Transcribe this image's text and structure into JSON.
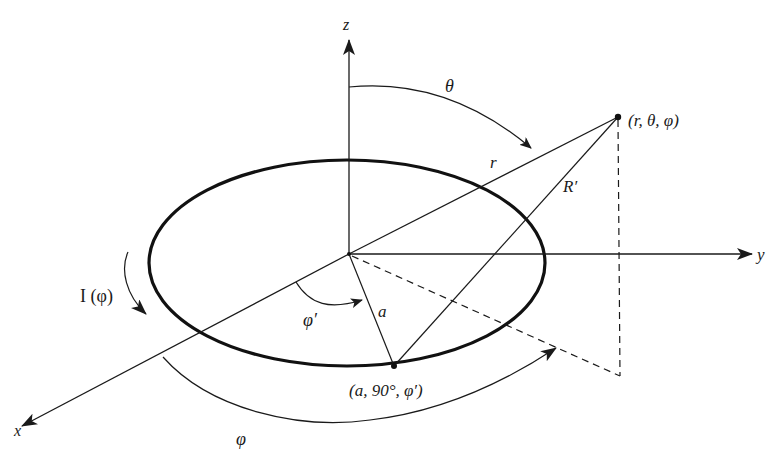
{
  "figure": {
    "axes": {
      "x": "x",
      "y": "y",
      "z": "z"
    },
    "labels": {
      "observation_point": "(r, θ, φ)",
      "source_point": "(a, 90°, φ′)",
      "current": "I (φ)",
      "theta": "θ",
      "phi": "φ",
      "phi_prime": "φ′",
      "r": "r",
      "R_prime": "R′",
      "a": "a"
    }
  }
}
